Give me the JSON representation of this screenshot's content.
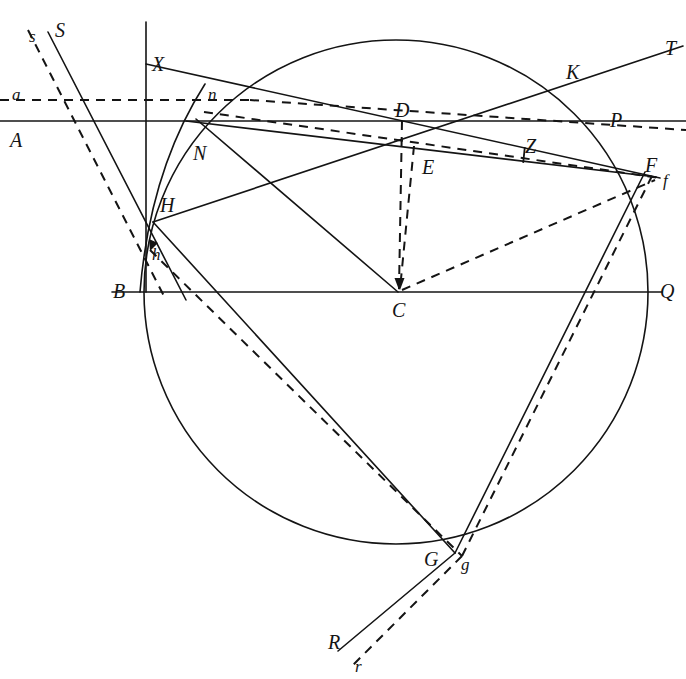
{
  "figure": {
    "type": "geometric-construction-diagram",
    "background_color": "#ffffff",
    "stroke_color": "#141414",
    "canvas": {
      "width": 686,
      "height": 679
    }
  },
  "circle": {
    "name": "main-circle",
    "center": {
      "x": 396,
      "y": 292
    },
    "radius": 252,
    "style": "solid"
  },
  "points": [
    {
      "id": "S",
      "label": "S",
      "x": 55,
      "y": 20,
      "case": "upper"
    },
    {
      "id": "s",
      "label": "s",
      "x": 29,
      "y": 28,
      "case": "lower"
    },
    {
      "id": "a",
      "label": "a",
      "x": 12,
      "y": 86,
      "case": "lower"
    },
    {
      "id": "A",
      "label": "A",
      "x": 10,
      "y": 130,
      "case": "upper"
    },
    {
      "id": "X",
      "label": "X",
      "x": 152,
      "y": 54,
      "case": "upper"
    },
    {
      "id": "n",
      "label": "n",
      "x": 208,
      "y": 86,
      "case": "lower"
    },
    {
      "id": "N",
      "label": "N",
      "x": 193,
      "y": 143,
      "case": "upper"
    },
    {
      "id": "H",
      "label": "H",
      "x": 160,
      "y": 195,
      "case": "upper"
    },
    {
      "id": "h",
      "label": "h",
      "x": 152,
      "y": 246,
      "case": "lower"
    },
    {
      "id": "B",
      "label": "B",
      "x": 113,
      "y": 281,
      "case": "upper"
    },
    {
      "id": "D",
      "label": "D",
      "x": 395,
      "y": 100,
      "case": "upper"
    },
    {
      "id": "E",
      "label": "E",
      "x": 422,
      "y": 157,
      "case": "upper"
    },
    {
      "id": "C",
      "label": "C",
      "x": 392,
      "y": 300,
      "case": "upper"
    },
    {
      "id": "Z",
      "label": "Z",
      "x": 525,
      "y": 136,
      "case": "upper"
    },
    {
      "id": "K",
      "label": "K",
      "x": 566,
      "y": 62,
      "case": "upper"
    },
    {
      "id": "T",
      "label": "T",
      "x": 665,
      "y": 38,
      "case": "upper"
    },
    {
      "id": "P",
      "label": "P",
      "x": 610,
      "y": 110,
      "case": "upper"
    },
    {
      "id": "F",
      "label": "F",
      "x": 645,
      "y": 155,
      "case": "upper"
    },
    {
      "id": "f",
      "label": "f",
      "x": 663,
      "y": 172,
      "case": "lower"
    },
    {
      "id": "Q",
      "label": "Q",
      "x": 660,
      "y": 281,
      "case": "upper"
    },
    {
      "id": "G",
      "label": "G",
      "x": 424,
      "y": 549,
      "case": "upper"
    },
    {
      "id": "g",
      "label": "g",
      "x": 461,
      "y": 556,
      "case": "lower"
    },
    {
      "id": "R",
      "label": "R",
      "x": 328,
      "y": 632,
      "case": "upper"
    },
    {
      "id": "r",
      "label": "r",
      "x": 355,
      "y": 658,
      "case": "lower"
    }
  ],
  "solid_lines": [
    {
      "name": "line-A-horizontal",
      "x1": 0,
      "y1": 121,
      "x2": 686,
      "y2": 121
    },
    {
      "name": "line-BQ-horizontal",
      "x1": 112,
      "y1": 292,
      "x2": 662,
      "y2": 292
    },
    {
      "name": "line-X-vertical",
      "x1": 146,
      "y1": 22,
      "x2": 146,
      "y2": 292
    },
    {
      "name": "line-S-oblique",
      "x1": 48,
      "y1": 32,
      "x2": 186,
      "y2": 300
    },
    {
      "name": "line-X-to-F",
      "x1": 146,
      "y1": 64,
      "x2": 660,
      "y2": 178
    },
    {
      "name": "line-N-to-F",
      "x1": 186,
      "y1": 121,
      "x2": 656,
      "y2": 177
    },
    {
      "name": "line-H-to-T",
      "x1": 153,
      "y1": 222,
      "x2": 683,
      "y2": 46
    },
    {
      "name": "line-N-to-C",
      "x1": 196,
      "y1": 119,
      "x2": 398,
      "y2": 292
    },
    {
      "name": "line-H-to-G",
      "x1": 153,
      "y1": 222,
      "x2": 455,
      "y2": 553
    },
    {
      "name": "line-G-to-R",
      "x1": 455,
      "y1": 553,
      "x2": 338,
      "y2": 651
    },
    {
      "name": "line-G-to-F",
      "x1": 455,
      "y1": 553,
      "x2": 645,
      "y2": 172
    },
    {
      "name": "arc-N-through-B",
      "path": "M 205 84 Q 150 170 140 292"
    }
  ],
  "dashed_lines": [
    {
      "name": "line-a-horizontal",
      "x1": 0,
      "y1": 100,
      "x2": 250,
      "y2": 100
    },
    {
      "name": "line-a-to-n-extension",
      "x1": 250,
      "y1": 100,
      "x2": 686,
      "y2": 130
    },
    {
      "name": "line-s-oblique",
      "x1": 28,
      "y1": 30,
      "x2": 166,
      "y2": 300
    },
    {
      "name": "line-n-to-f",
      "x1": 204,
      "y1": 112,
      "x2": 660,
      "y2": 178
    },
    {
      "name": "line-D-to-C",
      "x1": 402,
      "y1": 121,
      "x2": 399,
      "y2": 289
    },
    {
      "name": "line-E-to-C",
      "x1": 414,
      "y1": 146,
      "x2": 400,
      "y2": 289
    },
    {
      "name": "line-C-to-f",
      "x1": 402,
      "y1": 290,
      "x2": 655,
      "y2": 180
    },
    {
      "name": "line-h-to-g",
      "x1": 150,
      "y1": 250,
      "x2": 462,
      "y2": 556
    },
    {
      "name": "line-g-to-r",
      "x1": 462,
      "y1": 556,
      "x2": 352,
      "y2": 666
    },
    {
      "name": "line-g-to-f",
      "x1": 462,
      "y1": 556,
      "x2": 652,
      "y2": 176
    }
  ],
  "tick_marks": [
    {
      "name": "tick-Z-on-NF",
      "x": 524,
      "y": 155,
      "angle": 6
    }
  ],
  "arrowheads": [
    {
      "name": "arrowhead-D-to-C",
      "x": 399,
      "y": 289,
      "direction": "down"
    },
    {
      "name": "arrowhead-E-to-C",
      "x": 400,
      "y": 289,
      "direction": "down"
    },
    {
      "name": "arrowhead-at-h",
      "x": 150,
      "y": 250,
      "direction": "down-left"
    }
  ]
}
